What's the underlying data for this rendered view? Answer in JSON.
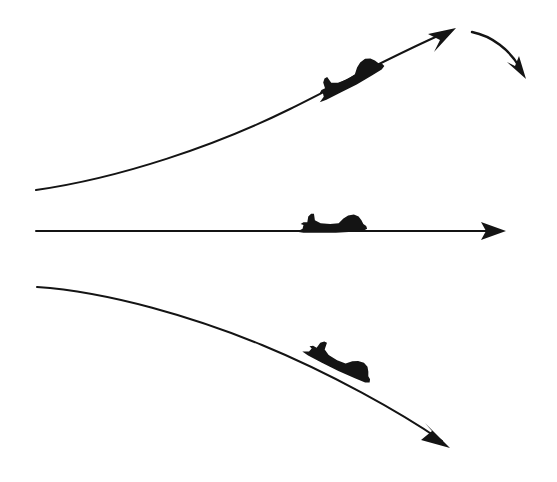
{
  "figure": {
    "background_color": "#ffffff",
    "ink_color": "#141414",
    "width": 557,
    "height": 482
  },
  "elements": {
    "climb_path": {
      "name": "climbing flight path",
      "stroke_width": 2.0,
      "d": "M 36 190 C 120 178 215 146 290 109 C 338 85 400 52 449 31",
      "start": [
        36,
        190
      ],
      "end": [
        449,
        31
      ]
    },
    "climb_arrowhead": {
      "name": "climb arrowhead",
      "d": "M 456 28 L 428 34 L 440 40 L 434 52 Z",
      "tip": [
        456,
        28
      ]
    },
    "level_path": {
      "name": "level flight path",
      "stroke_width": 2.0,
      "d": "M 36 231 L 497 231",
      "start": [
        36,
        231
      ],
      "end": [
        497,
        231
      ]
    },
    "level_arrowhead": {
      "name": "level arrowhead",
      "d": "M 506 231 L 481 222 L 486 231 L 481 240 Z",
      "tip": [
        506,
        231
      ]
    },
    "descent_path": {
      "name": "descending flight path",
      "stroke_width": 2.0,
      "d": "M 37 287 C 110 292 196 318 262 345 C 330 373 400 412 442 441",
      "start": [
        37,
        287
      ],
      "end": [
        442,
        441
      ]
    },
    "descent_arrowhead": {
      "name": "descent arrowhead",
      "d": "M 450 448 L 421 440 L 432 431 L 425 423 Z",
      "tip": [
        450,
        448
      ]
    },
    "recovery_curve": {
      "name": "curved recovery arrow",
      "stroke_width": 2.4,
      "d": "M 472 32 C 492 36 510 50 520 68",
      "start": [
        472,
        32
      ],
      "end": [
        520,
        68
      ]
    },
    "recovery_arrowhead": {
      "name": "curved arrow arrowhead",
      "d": "M 526 79 L 507 62 L 515 66 L 519 56 Z",
      "tip": [
        526,
        79
      ]
    }
  },
  "aircraft": [
    {
      "id": "aircraft-climbing",
      "label": "climbing aircraft",
      "attitude": "nose-up",
      "rotation_deg": -27,
      "position": [
        350,
        80
      ],
      "scale": 1.0
    },
    {
      "id": "aircraft-level",
      "label": "level aircraft",
      "attitude": "level",
      "rotation_deg": 0,
      "position": [
        332,
        226
      ],
      "scale": 0.95
    },
    {
      "id": "aircraft-descending",
      "label": "descending aircraft",
      "attitude": "nose-down",
      "rotation_deg": 27,
      "position": [
        338,
        363
      ],
      "scale": 1.0
    }
  ],
  "aircraft_silhouette": {
    "name": "jet-aircraft-silhouette",
    "d": "M -37 6 L -31 3 L -30 -1 L -33 -2 L -30 -4 L -26 -4 L -25 -10 L -22 -13 L -19 -13 L -18 -6 L -12 -3 L -2 -2 L 7 -3 L 12 -8 L 17 -11 L 23 -12 L 28 -10 L 31 -6 L 33 -2 L 36 0 L 37 3 L 33 5 L 22 6 L 4 7 L -14 7 L -30 7 Z"
  }
}
